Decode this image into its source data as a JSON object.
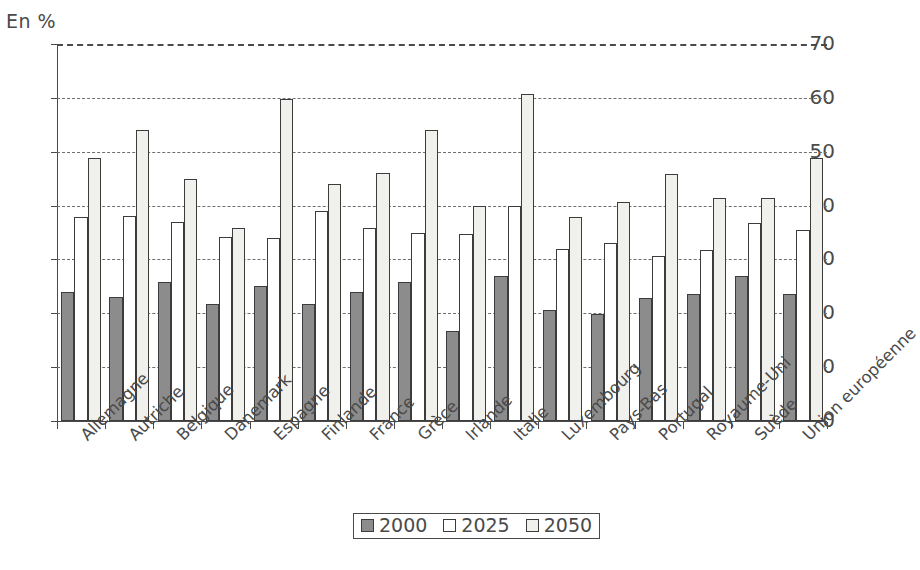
{
  "axis_unit_label": "En %",
  "legend": {
    "items": [
      {
        "label": "2000",
        "color": "#8c8c8c"
      },
      {
        "label": "2025",
        "color": "#ffffff"
      },
      {
        "label": "2050",
        "color": "#f0f0ec"
      }
    ]
  },
  "chart_data": {
    "type": "bar",
    "title": "",
    "xlabel": "",
    "ylabel": "En %",
    "ylim": [
      0,
      70
    ],
    "yticks": [
      0,
      10,
      20,
      30,
      40,
      50,
      60,
      70
    ],
    "grid": true,
    "legend_position": "bottom-center",
    "categories": [
      "Allemagne",
      "Autriche",
      "Belgique",
      "Danemark",
      "Espagne",
      "Finlande",
      "France",
      "Grèce",
      "Irlande",
      "Italie",
      "Luxembourg",
      "Pays-Bas",
      "Portugal",
      "Royaume-Uni",
      "Suède",
      "Union européenne"
    ],
    "series": [
      {
        "name": "2000",
        "color": "#8c8c8c",
        "values": [
          24.0,
          23.0,
          25.9,
          21.7,
          25.0,
          21.7,
          24.0,
          25.8,
          16.8,
          27.0,
          20.7,
          19.9,
          22.8,
          23.6,
          27.0,
          23.6
        ]
      },
      {
        "name": "2025",
        "color": "#ffffff",
        "values": [
          37.8,
          38.0,
          37.0,
          34.1,
          34.0,
          39.0,
          35.8,
          35.0,
          34.7,
          40.0,
          31.9,
          33.0,
          30.6,
          31.8,
          36.7,
          35.5
        ]
      },
      {
        "name": "2050",
        "color": "#f0f0ec",
        "values": [
          48.8,
          54.0,
          45.0,
          35.8,
          59.8,
          44.0,
          46.0,
          54.0,
          40.0,
          60.8,
          37.8,
          40.6,
          45.8,
          41.5,
          41.5,
          48.8
        ]
      }
    ]
  }
}
